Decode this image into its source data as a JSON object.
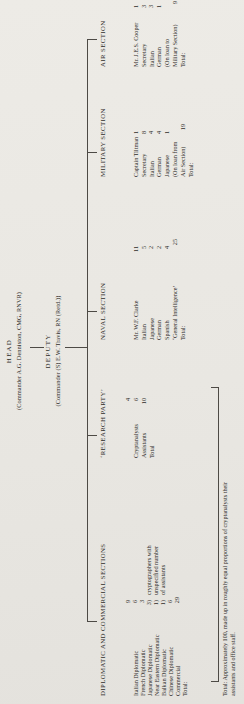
{
  "page": {
    "head": {
      "title": "HEAD",
      "name": "(Commander A.G. Denniston, CMG, RNVR)"
    },
    "deputy": {
      "title": "DEPUTY",
      "name": "(Commander (S) E.W. Travis, RN (Retd.))"
    },
    "footnote": {
      "line1": "Total: Approximately 100, made up in roughly equal proportions of cryptanalysts their",
      "line2": "assistants and office staff."
    },
    "colors": {
      "paper": "#e9e7e2",
      "ink": "#2f2d2a",
      "line": "#4d4a45"
    }
  },
  "sections": [
    {
      "heading": "DIPLOMATIC AND COMMERCIAL SECTIONS",
      "rows": [
        {
          "label": "Italian Diplomatic",
          "value": "9",
          "note": ""
        },
        {
          "label": "French Diplomatic",
          "value": "6",
          "note": ""
        },
        {
          "label": "Japanese Diplomatic",
          "value": "3",
          "note": ""
        },
        {
          "label": "Near Eastern Diplomatic",
          "value": "3)",
          "note": "cryptographers with"
        },
        {
          "label": "Balkan Diplomatic",
          "value": "1)",
          "note": "unspecified number"
        },
        {
          "label": "Chinese Diplomatic",
          "value": "1)",
          "note": "of assistants"
        },
        {
          "label": "Commercial",
          "value": "6",
          "note": ""
        },
        {
          "label": "Total:",
          "value": "29",
          "note": ""
        }
      ]
    },
    {
      "heading": "‘RESEARCH PARTY’",
      "rows": [
        {
          "label": "Cryptanalysts",
          "value": "4"
        },
        {
          "label": "Assistants",
          "value": "6"
        },
        {
          "label": "Total",
          "value": "10"
        }
      ]
    },
    {
      "heading": "NAVAL SECTION",
      "rows": [
        {
          "label": "Mr. W.F. Clarke",
          "value": ""
        },
        {
          "label": "Italian",
          "value": "11"
        },
        {
          "label": "Japanese",
          "value": "5"
        },
        {
          "label": "German",
          "value": "2"
        },
        {
          "label": "Spanish",
          "value": "2"
        },
        {
          "label": "‘General Intelligence’",
          "value": "4"
        },
        {
          "label": "Total:",
          "value": "25"
        }
      ]
    },
    {
      "heading": "MILITARY SECTION",
      "rows": [
        {
          "label": "Captain Tiltman",
          "value": ""
        },
        {
          "label": "Secretary",
          "value": "1"
        },
        {
          "label": "Italian",
          "value": "8"
        },
        {
          "label": "German",
          "value": "4"
        },
        {
          "label": "Japanese",
          "value": "4"
        },
        {
          "label": "(On loan from",
          "value": "1"
        },
        {
          "label": "Air Section)",
          "value": ""
        },
        {
          "label": "Total:",
          "value": "19"
        }
      ]
    },
    {
      "heading": "AIR SECTION",
      "rows": [
        {
          "label": "Mr. J.E.S. Cooper",
          "value": ""
        },
        {
          "label": "Secretary",
          "value": "1"
        },
        {
          "label": "Italian",
          "value": "3"
        },
        {
          "label": "German",
          "value": "3"
        },
        {
          "label": "(On loan to",
          "value": "1"
        },
        {
          "label": "Military Section)",
          "value": ""
        },
        {
          "label": "Total:",
          "value": "9"
        }
      ]
    }
  ]
}
